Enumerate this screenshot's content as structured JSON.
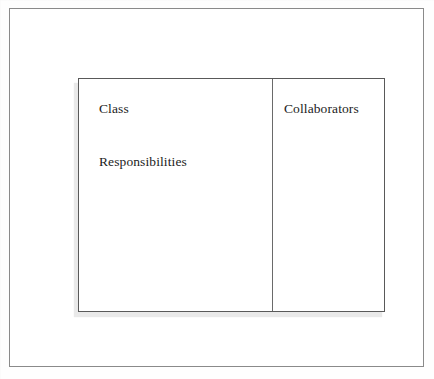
{
  "figure": {
    "background_color": "#fefefe"
  },
  "outer_frame": {
    "border_color": "#8a8a8a",
    "fill_color": "#ffffff"
  },
  "card": {
    "border_color": "#595959",
    "fill_color": "#ffffff",
    "shadow_color": "#e9e9e9",
    "divider_color": "#6a6a6a",
    "columns": [
      {
        "name": "left-column",
        "labels": [
          {
            "key": "class",
            "text": "Class"
          },
          {
            "key": "responsibilities",
            "text": "Responsibilities"
          }
        ]
      },
      {
        "name": "right-column",
        "labels": [
          {
            "key": "collaborators",
            "text": "Collaborators"
          }
        ]
      }
    ]
  },
  "labels": {
    "class": "Class",
    "responsibilities": "Responsibilities",
    "collaborators": "Collaborators"
  }
}
